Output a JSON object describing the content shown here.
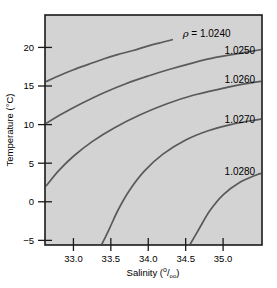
{
  "chart_data": {
    "type": "line",
    "title": "",
    "subtitle": "",
    "xlabel": "Salinity (°/₀₀)",
    "ylabel": "Temperature (°C)",
    "xlabel_parts": {
      "text": "Salinity (",
      "numerator": "o",
      "slash": "/",
      "denominator": "oo",
      "close": ")"
    },
    "ylabel_parts": {
      "text": "Temperature (°C)"
    },
    "xlim": [
      32.62,
      35.52
    ],
    "ylim": [
      -5.6,
      24.2
    ],
    "xticks": [
      33.0,
      33.5,
      34.0,
      34.5,
      35.0
    ],
    "xticklabels": [
      "33.0",
      "33.5",
      "34.0",
      "34.5",
      "35.0"
    ],
    "yticks": [
      -5,
      0,
      5,
      10,
      15,
      20
    ],
    "yticklabels": [
      "−5",
      "0",
      "5",
      "10",
      "15",
      "20"
    ],
    "grid": false,
    "legend": "none",
    "plot_background_color": "#d3d3d3",
    "curve_color": "#5a5a5a",
    "axis_color": "#1a1a1a",
    "variable_symbol": "ρ",
    "equals_sign": "=",
    "series": [
      {
        "name": "1.0240",
        "label": "1.0240",
        "label_prefix": "ρ = ",
        "points": [
          [
            32.64,
            15.6
          ],
          [
            32.8,
            16.3
          ],
          [
            33.0,
            17.1
          ],
          [
            33.2,
            17.8
          ],
          [
            33.4,
            18.5
          ],
          [
            33.6,
            19.1
          ],
          [
            33.8,
            19.6
          ],
          [
            34.0,
            20.2
          ],
          [
            34.2,
            20.7
          ],
          [
            34.32,
            21.0
          ]
        ]
      },
      {
        "name": "1.0250",
        "label": "1.0250",
        "label_prefix": "",
        "points": [
          [
            32.64,
            10.2
          ],
          [
            32.85,
            11.4
          ],
          [
            33.1,
            12.7
          ],
          [
            33.4,
            14.1
          ],
          [
            33.7,
            15.3
          ],
          [
            34.0,
            16.3
          ],
          [
            34.3,
            17.2
          ],
          [
            34.6,
            18.0
          ],
          [
            34.9,
            18.7
          ],
          [
            35.2,
            19.2
          ],
          [
            35.5,
            19.7
          ]
        ]
      },
      {
        "name": "1.0260",
        "label": "1.0260",
        "label_prefix": "",
        "points": [
          [
            32.64,
            2.1
          ],
          [
            32.8,
            4.0
          ],
          [
            33.0,
            5.9
          ],
          [
            33.25,
            7.8
          ],
          [
            33.55,
            9.6
          ],
          [
            33.9,
            11.3
          ],
          [
            34.25,
            12.7
          ],
          [
            34.6,
            13.8
          ],
          [
            34.95,
            14.6
          ],
          [
            35.25,
            15.2
          ],
          [
            35.5,
            15.6
          ]
        ]
      },
      {
        "name": "1.0270",
        "label": "1.0270",
        "label_prefix": "",
        "points": [
          [
            33.38,
            -5.5
          ],
          [
            33.48,
            -3.5
          ],
          [
            33.6,
            -1.0
          ],
          [
            33.75,
            1.5
          ],
          [
            33.95,
            4.0
          ],
          [
            34.2,
            6.2
          ],
          [
            34.5,
            8.0
          ],
          [
            34.8,
            9.2
          ],
          [
            35.1,
            10.0
          ],
          [
            35.5,
            10.7
          ]
        ]
      },
      {
        "name": "1.0280",
        "label": "1.0280",
        "label_prefix": "",
        "points": [
          [
            34.56,
            -5.5
          ],
          [
            34.68,
            -3.5
          ],
          [
            34.82,
            -1.2
          ],
          [
            35.0,
            0.9
          ],
          [
            35.22,
            2.5
          ],
          [
            35.45,
            3.5
          ],
          [
            35.52,
            3.7
          ]
        ]
      }
    ],
    "contour_labels": [
      {
        "text": "1.0240",
        "prefix": "ρ = ",
        "x": 34.46,
        "y": 21.8
      },
      {
        "text": "1.0250",
        "prefix": "",
        "x": 35.02,
        "y": 19.6
      },
      {
        "text": "1.0260",
        "prefix": "",
        "x": 35.02,
        "y": 15.8
      },
      {
        "text": "1.0270",
        "prefix": "",
        "x": 35.02,
        "y": 10.6
      },
      {
        "text": "1.0280",
        "prefix": "",
        "x": 35.02,
        "y": 3.9
      }
    ]
  }
}
